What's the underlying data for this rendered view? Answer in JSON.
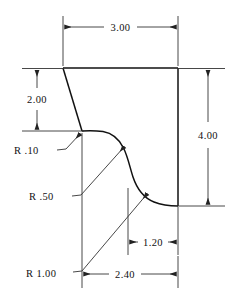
{
  "drawing": {
    "title": "Engineering Part Profile Drawing",
    "units_note": "",
    "background_color": "#ffffff",
    "line_color": "#111111",
    "dimension_color": "#333333"
  },
  "dimensions": [
    {
      "id": "width-top",
      "label": "3.00",
      "orientation": "horizontal",
      "position": "top",
      "from_x": 63,
      "to_x": 178,
      "at_y": 27
    },
    {
      "id": "height-left",
      "label": "2.00",
      "orientation": "vertical",
      "position": "left",
      "from_y": 69,
      "to_y": 131,
      "at_x": 37
    },
    {
      "id": "height-right",
      "label": "4.00",
      "orientation": "vertical",
      "position": "right",
      "from_y": 69,
      "to_y": 206,
      "at_x": 208
    },
    {
      "id": "width-lower-inner",
      "label": "1.20",
      "orientation": "horizontal",
      "position": "bottom-inner",
      "from_x": 128,
      "to_x": 178,
      "at_y": 242
    },
    {
      "id": "width-bottom",
      "label": "2.40",
      "orientation": "horizontal",
      "position": "bottom",
      "from_x": 82,
      "to_x": 178,
      "at_y": 274
    }
  ],
  "radii": [
    {
      "id": "radius-small",
      "label": "R .10",
      "text_x": 14,
      "text_y": 154,
      "leader_from_x": 57,
      "leader_from_y": 150,
      "leader_to_x": 83,
      "leader_to_y": 133
    },
    {
      "id": "radius-medium",
      "label": "R .50",
      "text_x": 29,
      "text_y": 200,
      "leader_from_x": 72,
      "leader_from_y": 196,
      "leader_to_x": 126,
      "leader_to_y": 146
    },
    {
      "id": "radius-large",
      "label": "R 1.00",
      "text_x": 26,
      "text_y": 277,
      "leader_from_x": 73,
      "leader_from_y": 272,
      "leader_to_x": 149,
      "leader_to_y": 193
    }
  ],
  "profile": {
    "description": "Part outline with slanted left edge, S-shaped fillet curve and vertical right edge",
    "top_left_x": 63,
    "top_right_x": 178,
    "top_y": 68,
    "slant_bottom_x": 82,
    "slant_bottom_y": 131,
    "bottom_y": 206,
    "path": "M 63 68 L 178 68 L 178 206 L 160 206 C 146 206 138 200 132 188 C 126 176 126 162 120 152 C 114 142 104 133 94 131.5 L 82 131 L 63 68 Z"
  }
}
